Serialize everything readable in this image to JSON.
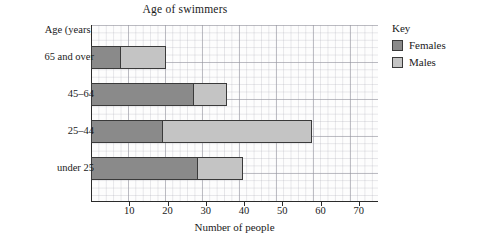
{
  "chart_data": {
    "type": "bar",
    "orientation": "horizontal",
    "stacked": true,
    "title": "Age of swimmers",
    "xlabel": "Number of people",
    "ylabel": "Age (years)",
    "categories": [
      "65 and over",
      "45–64",
      "25–44",
      "under 25"
    ],
    "series": [
      {
        "name": "Females",
        "color": "#8a8a8a",
        "values": [
          8,
          27,
          19,
          28
        ]
      },
      {
        "name": "Males",
        "color": "#c4c4c4",
        "values": [
          12,
          9,
          39,
          12
        ]
      }
    ],
    "totals": [
      20,
      36,
      58,
      40
    ],
    "xlim": [
      0,
      75
    ],
    "xticks": [
      10,
      20,
      30,
      40,
      50,
      60,
      70
    ],
    "xtick_labels": [
      "10",
      "20",
      "30",
      "40",
      "50",
      "60",
      "70"
    ],
    "grid": true,
    "grid_minor_step": 2,
    "legend_position": "right",
    "legend_title": "Key"
  },
  "axis": {
    "y_header": "Age (years)",
    "x_title": "Number of people"
  },
  "legend": {
    "title": "Key",
    "entries": [
      {
        "label": "Females",
        "color": "#8a8a8a"
      },
      {
        "label": "Males",
        "color": "#c4c4c4"
      }
    ]
  },
  "style": {
    "bar_border": "#3a3a3a",
    "axis_color": "#2b2b2b",
    "grid_color": "#9a9aa4",
    "plot_bg": "#fdfdfd"
  }
}
